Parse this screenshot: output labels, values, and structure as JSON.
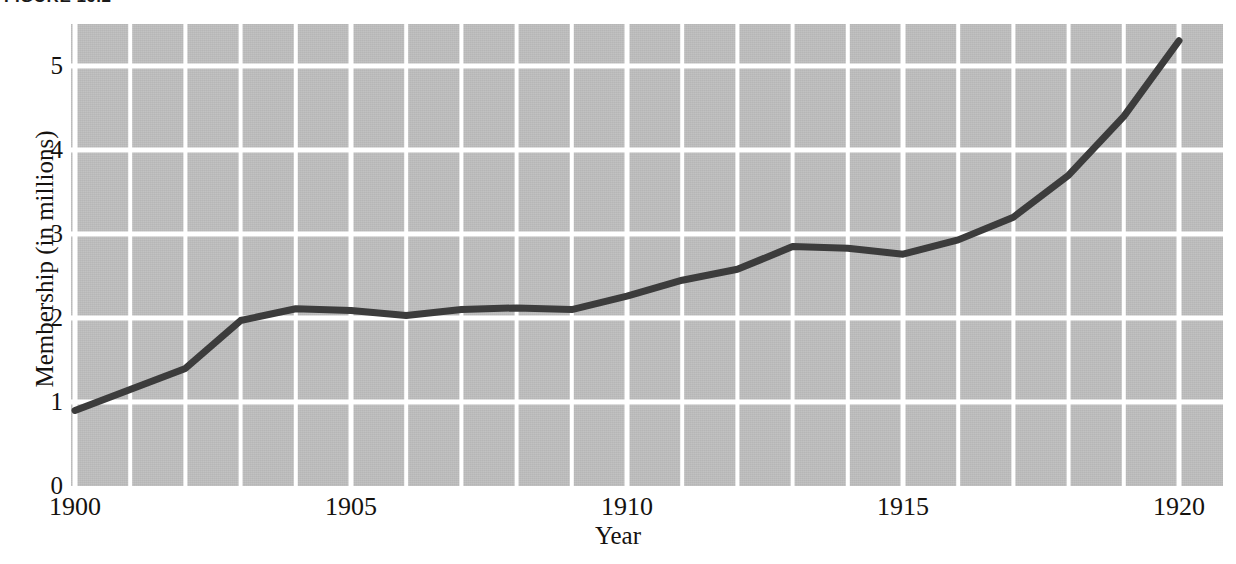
{
  "figure": {
    "caption_clipped": "FIGURE 19.2"
  },
  "axes": {
    "x_title": "Year",
    "y_title": "Membership (in millions)",
    "x_ticks": [
      "1900",
      "1905",
      "1910",
      "1915",
      "1920"
    ],
    "y_ticks": [
      "0",
      "1",
      "2",
      "3",
      "4",
      "5"
    ]
  },
  "colors": {
    "plot_background": "#bebebe",
    "gridline": "#ffffff",
    "series_line": "#3c3c3c",
    "text": "#15120f",
    "page_background": "#ffffff"
  },
  "chart_data": {
    "type": "line",
    "title": "",
    "xlabel": "Year",
    "ylabel": "Membership (in millions)",
    "xlim": [
      1900,
      1920
    ],
    "ylim": [
      0,
      5.5
    ],
    "grid": true,
    "legend": "none",
    "x_tick_values": [
      1900,
      1905,
      1910,
      1915,
      1920
    ],
    "y_tick_values": [
      0,
      1,
      2,
      3,
      4,
      5
    ],
    "x": [
      1900,
      1901,
      1902,
      1903,
      1904,
      1905,
      1906,
      1907,
      1908,
      1909,
      1910,
      1911,
      1912,
      1913,
      1914,
      1915,
      1916,
      1917,
      1918,
      1919,
      1920
    ],
    "series": [
      {
        "name": "Membership",
        "values": [
          0.9,
          1.15,
          1.4,
          1.97,
          2.11,
          2.09,
          2.03,
          2.1,
          2.12,
          2.1,
          2.26,
          2.45,
          2.58,
          2.85,
          2.83,
          2.76,
          2.93,
          3.2,
          3.7,
          4.4,
          5.3
        ]
      }
    ]
  }
}
